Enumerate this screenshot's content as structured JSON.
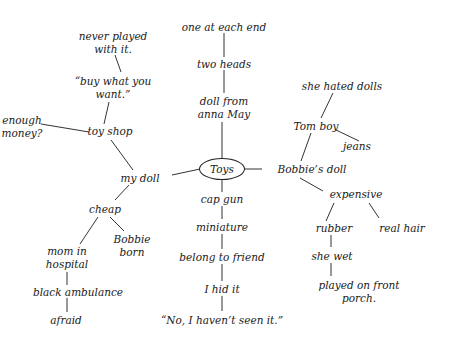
{
  "title": "Toys",
  "center": {
    "label": "Toys",
    "x": 222,
    "y": 169
  },
  "nodes": [
    {
      "id": "one-at-each-end",
      "lines": [
        "one at each end"
      ],
      "x": 224,
      "y": 27
    },
    {
      "id": "two-heads",
      "lines": [
        "two heads"
      ],
      "x": 224,
      "y": 64
    },
    {
      "id": "doll-from-anna-may",
      "lines": [
        "doll from",
        "anna May"
      ],
      "x": 224,
      "y": 108
    },
    {
      "id": "never-played",
      "lines": [
        "never played",
        "with it."
      ],
      "x": 113,
      "y": 43
    },
    {
      "id": "buy-what-you-want",
      "lines": [
        "“buy what you",
        "want.”"
      ],
      "x": 113,
      "y": 88
    },
    {
      "id": "enough-money",
      "lines": [
        "enough",
        "money?"
      ],
      "x": 22,
      "y": 127
    },
    {
      "id": "toy-shop",
      "lines": [
        "toy shop"
      ],
      "x": 110,
      "y": 131
    },
    {
      "id": "my-doll",
      "lines": [
        "my doll"
      ],
      "x": 140,
      "y": 178
    },
    {
      "id": "cheap",
      "lines": [
        "cheap"
      ],
      "x": 105,
      "y": 209
    },
    {
      "id": "mom-in-hospital",
      "lines": [
        "mom in",
        "hospital"
      ],
      "x": 67,
      "y": 258
    },
    {
      "id": "bobbie-born",
      "lines": [
        "Bobbie",
        "born"
      ],
      "x": 132,
      "y": 246
    },
    {
      "id": "black-ambulance",
      "lines": [
        "black ambulance"
      ],
      "x": 78,
      "y": 292
    },
    {
      "id": "afraid",
      "lines": [
        "afraid"
      ],
      "x": 66,
      "y": 320
    },
    {
      "id": "cap-gun",
      "lines": [
        "cap gun"
      ],
      "x": 222,
      "y": 199
    },
    {
      "id": "miniature",
      "lines": [
        "miniature"
      ],
      "x": 222,
      "y": 227
    },
    {
      "id": "belong-to-friend",
      "lines": [
        "belong to friend"
      ],
      "x": 222,
      "y": 257
    },
    {
      "id": "i-hid-it",
      "lines": [
        "I hid it"
      ],
      "x": 222,
      "y": 289
    },
    {
      "id": "no-havent-seen",
      "lines": [
        "“No, I haven’t seen it.”"
      ],
      "x": 222,
      "y": 320
    },
    {
      "id": "she-hated-dolls",
      "lines": [
        "she hated dolls"
      ],
      "x": 342,
      "y": 86
    },
    {
      "id": "tom-boy",
      "lines": [
        "Tom boy"
      ],
      "x": 316,
      "y": 126
    },
    {
      "id": "jeans",
      "lines": [
        "jeans"
      ],
      "x": 357,
      "y": 146
    },
    {
      "id": "bobbies-doll",
      "lines": [
        "Bobbie’s doll"
      ],
      "x": 312,
      "y": 169
    },
    {
      "id": "expensive",
      "lines": [
        "expensive"
      ],
      "x": 356,
      "y": 194
    },
    {
      "id": "rubber",
      "lines": [
        "rubber"
      ],
      "x": 334,
      "y": 228
    },
    {
      "id": "real-hair",
      "lines": [
        "real hair"
      ],
      "x": 402,
      "y": 228
    },
    {
      "id": "she-wet",
      "lines": [
        "she wet"
      ],
      "x": 332,
      "y": 256
    },
    {
      "id": "played-on-front-porch",
      "lines": [
        "played on front",
        "porch."
      ],
      "x": 359,
      "y": 292
    }
  ],
  "edges": [
    [
      224,
      33,
      224,
      57
    ],
    [
      224,
      70,
      224,
      93
    ],
    [
      222,
      122,
      222,
      159
    ],
    [
      115,
      55,
      121,
      72
    ],
    [
      109,
      102,
      104,
      124
    ],
    [
      41,
      124,
      89,
      132
    ],
    [
      111,
      140,
      133,
      170
    ],
    [
      172,
      175,
      200,
      169
    ],
    [
      129,
      185,
      115,
      200
    ],
    [
      98,
      217,
      80,
      244
    ],
    [
      110,
      217,
      124,
      231
    ],
    [
      67,
      272,
      67,
      285
    ],
    [
      67,
      298,
      67,
      312
    ],
    [
      222,
      179,
      222,
      192
    ],
    [
      222,
      206,
      222,
      219
    ],
    [
      222,
      234,
      222,
      249
    ],
    [
      222,
      264,
      222,
      281
    ],
    [
      222,
      296,
      222,
      311
    ],
    [
      244,
      169,
      262,
      169
    ],
    [
      301,
      161,
      311,
      133
    ],
    [
      333,
      93,
      321,
      118
    ],
    [
      336,
      130,
      359,
      141
    ],
    [
      300,
      178,
      323,
      191
    ],
    [
      334,
      203,
      326,
      221
    ],
    [
      369,
      203,
      379,
      218
    ],
    [
      331,
      235,
      331,
      247
    ],
    [
      331,
      263,
      331,
      276
    ]
  ]
}
